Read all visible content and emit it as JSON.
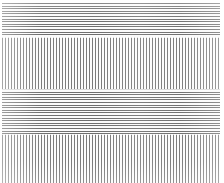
{
  "image": {
    "title": "Line grating test pattern",
    "width_px": 224,
    "height_px": 183,
    "background_color": "#ffffff",
    "line_color_horizontal": "#6e6e6e",
    "line_color_vertical": "#7a7a7a",
    "description": "Grayscale plate of alternating horizontal bands filled with fine horizontal and vertical line gratings"
  },
  "margins": {
    "left_px": 2,
    "right_px": 4,
    "top_px": 3,
    "bottom_px": 0
  },
  "bands": [
    {
      "name": "band-1",
      "orientation": "horizontal",
      "top_px": 3,
      "height_px": 34,
      "line_period_px": 2.6,
      "line_width_px": 1,
      "line_color": "#6e6e6e"
    },
    {
      "name": "band-2",
      "orientation": "vertical",
      "top_px": 37,
      "height_px": 52,
      "line_period_px": 3,
      "line_width_px": 1,
      "line_color": "#7a7a7a"
    },
    {
      "name": "band-3",
      "orientation": "horizontal",
      "top_px": 89,
      "height_px": 45,
      "line_period_px": 2.6,
      "line_width_px": 1,
      "line_color": "#6e6e6e"
    },
    {
      "name": "band-4",
      "orientation": "vertical",
      "top_px": 134,
      "height_px": 49,
      "line_period_px": 3,
      "line_width_px": 1,
      "line_color": "#7a7a7a"
    }
  ],
  "seams": [
    {
      "name": "seam-1",
      "y_px": 37
    },
    {
      "name": "seam-2",
      "y_px": 89
    },
    {
      "name": "seam-3",
      "y_px": 134
    }
  ]
}
